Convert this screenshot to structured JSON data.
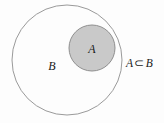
{
  "figure": {
    "type": "venn-diagram",
    "background_color": "#fdfdfd",
    "outer_set": {
      "name": "B",
      "label": "B",
      "center_x": 67,
      "center_y": 60,
      "radius": 55,
      "fill": "none",
      "stroke": "#9a9a9a",
      "stroke_width": 1,
      "label_x": 52,
      "label_y": 70
    },
    "inner_set": {
      "name": "A",
      "label": "A",
      "center_x": 92,
      "center_y": 48,
      "radius": 23,
      "fill": "#c9c9c9",
      "stroke": "#8f8f8f",
      "stroke_width": 1,
      "label_x": 88,
      "label_y": 53
    },
    "relation": {
      "left_operand": "A",
      "operator": "⊂",
      "right_operand": "B",
      "full_text": "A ⊂ B",
      "x": 126,
      "y": 56
    }
  }
}
